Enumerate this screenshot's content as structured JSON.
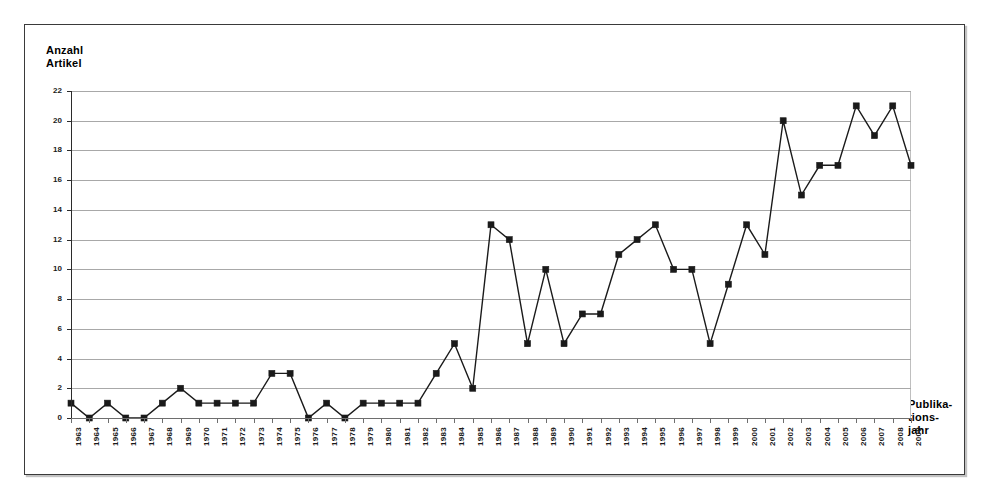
{
  "chart_data": {
    "type": "line",
    "title": "",
    "subtitle": "",
    "ylabel": "Anzahl Artikel",
    "ylabel_lines": [
      "Anzahl",
      "Artikel"
    ],
    "xlabel": "Publikationsjahr",
    "xlabel_lines": [
      "Publika-",
      "tions-",
      "jahr"
    ],
    "ylim": [
      0,
      22
    ],
    "ytick_step": 2,
    "yticks": [
      0,
      2,
      4,
      6,
      8,
      10,
      12,
      14,
      16,
      18,
      20,
      22
    ],
    "ytick_labels": [
      "0",
      "2",
      "4",
      "6",
      "8",
      "10",
      "12",
      "14",
      "16",
      "18",
      "20",
      "22"
    ],
    "grid": true,
    "grid_axis": "y",
    "legend": false,
    "legend_position": "none",
    "marker": "square",
    "line_color": "#1a1a1a",
    "marker_color": "#1a1a1a",
    "grid_color": "#a8a8a8",
    "categories": [
      "1963",
      "1964",
      "1965",
      "1966",
      "1967",
      "1968",
      "1969",
      "1970",
      "1971",
      "1972",
      "1973",
      "1974",
      "1975",
      "1976",
      "1977",
      "1978",
      "1979",
      "1980",
      "1981",
      "1982",
      "1983",
      "1984",
      "1985",
      "1986",
      "1987",
      "1988",
      "1989",
      "1990",
      "1991",
      "1992",
      "1993",
      "1994",
      "1995",
      "1996",
      "1997",
      "1998",
      "1999",
      "2000",
      "2001",
      "2002",
      "2003",
      "2004",
      "2005",
      "2006",
      "2007",
      "2008",
      "2009"
    ],
    "values": [
      1,
      0,
      1,
      0,
      0,
      1,
      2,
      1,
      1,
      1,
      1,
      3,
      3,
      0,
      1,
      0,
      1,
      1,
      1,
      1,
      3,
      5,
      2,
      13,
      12,
      5,
      10,
      5,
      7,
      7,
      11,
      12,
      13,
      10,
      10,
      5,
      9,
      13,
      11,
      20,
      15,
      17,
      17,
      21,
      19,
      21,
      17
    ],
    "series": [
      {
        "name": "Anzahl Artikel",
        "values": [
          1,
          0,
          1,
          0,
          0,
          1,
          2,
          1,
          1,
          1,
          1,
          3,
          3,
          0,
          1,
          0,
          1,
          1,
          1,
          1,
          3,
          5,
          2,
          13,
          12,
          5,
          10,
          5,
          7,
          7,
          11,
          12,
          13,
          10,
          10,
          5,
          9,
          13,
          11,
          20,
          15,
          17,
          17,
          21,
          19,
          21,
          17
        ]
      }
    ]
  }
}
